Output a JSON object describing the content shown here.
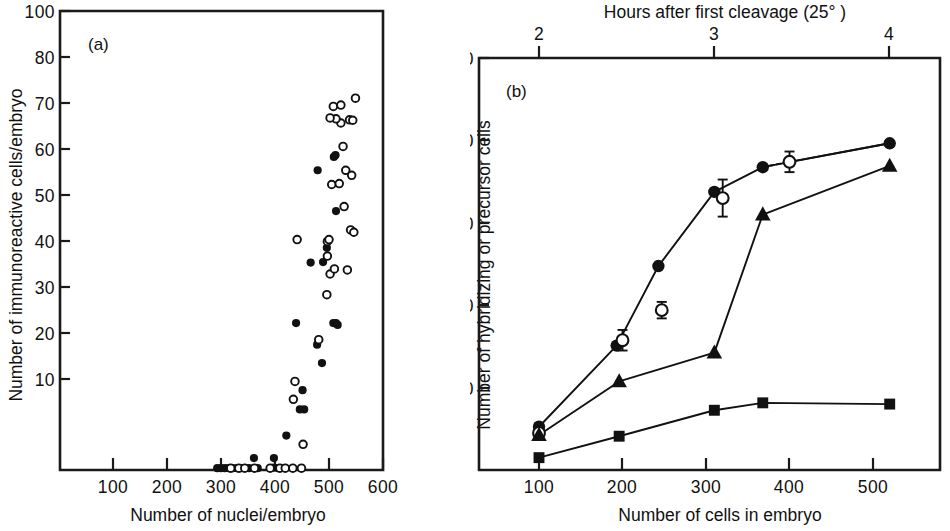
{
  "figure": {
    "panels": [
      "a",
      "b"
    ]
  },
  "panel_a": {
    "label": "(a)",
    "xlabel": "Number of nuclei/embryo",
    "ylabel": "Number of immunoreactive cells/embryo",
    "xticks": [
      "100",
      "200",
      "300",
      "400",
      "500",
      "600"
    ],
    "yticks": [
      "10",
      "20",
      "30",
      "40",
      "50",
      "60",
      "70",
      "80",
      "100"
    ],
    "legend": [
      "filled circle",
      "open circle"
    ]
  },
  "panel_b": {
    "label": "(b)",
    "xlabel": "Number of cells in embryo",
    "ylabel": "Number of hybridizing or precursor cells",
    "toplabel": "Hours after first cleavage (25° )",
    "xticks": [
      "100",
      "200",
      "300",
      "400",
      "500"
    ],
    "topticks": [
      "2",
      "3",
      "4"
    ],
    "yticks": [
      "20",
      "40",
      "60",
      "80",
      "100"
    ]
  },
  "chart_data": [
    {
      "type": "scatter",
      "panel": "a",
      "title": "(a)",
      "xlabel": "Number of nuclei/embryo",
      "ylabel": "Number of immunoreactive cells/embryo",
      "xlim": [
        0,
        650
      ],
      "ylim": [
        0,
        100
      ],
      "xticks": [
        100,
        200,
        300,
        400,
        500,
        600
      ],
      "yticks": [
        10,
        20,
        30,
        40,
        50,
        60,
        70,
        80,
        100
      ],
      "grid": false,
      "legend_position": "none",
      "series": [
        {
          "name": "filled circles",
          "marker": "filled-circle",
          "points": [
            [
              293,
              0.4
            ],
            [
              300,
              0.4
            ],
            [
              307,
              0.4
            ],
            [
              314,
              0.4
            ],
            [
              322,
              0.4
            ],
            [
              330,
              0.4
            ],
            [
              337,
              0.4
            ],
            [
              352,
              0.4
            ],
            [
              361,
              2.6
            ],
            [
              368,
              0.4
            ],
            [
              398,
              2.6
            ],
            [
              398,
              0.5
            ],
            [
              406,
              0.4
            ],
            [
              421,
              7.5
            ],
            [
              446,
              13.2
            ],
            [
              454,
              13.2
            ],
            [
              451,
              17.4
            ],
            [
              439,
              32.0
            ],
            [
              487,
              23.3
            ],
            [
              478,
              27.3
            ],
            [
              508,
              32.0
            ],
            [
              513,
              32.0
            ],
            [
              516,
              31.6
            ],
            [
              466,
              45.2
            ],
            [
              489,
              45.3
            ],
            [
              496,
              48.4
            ],
            [
              479,
              65.3
            ],
            [
              513,
              56.4
            ],
            [
              509,
              68.2
            ],
            [
              512,
              68.6
            ]
          ]
        },
        {
          "name": "open circles",
          "marker": "open-circle",
          "points": [
            [
              318,
              0.4
            ],
            [
              333,
              0.4
            ],
            [
              344,
              0.4
            ],
            [
              362,
              0.4
            ],
            [
              391,
              0.4
            ],
            [
              409,
              0.4
            ],
            [
              419,
              0.4
            ],
            [
              433,
              0.4
            ],
            [
              449,
              0.4
            ],
            [
              452,
              5.6
            ],
            [
              434,
              15.4
            ],
            [
              437,
              19.3
            ],
            [
              481,
              28.4
            ],
            [
              496,
              38.2
            ],
            [
              502,
              42.7
            ],
            [
              441,
              50.2
            ],
            [
              497,
              49.8
            ],
            [
              500,
              50.2
            ],
            [
              497,
              46.6
            ],
            [
              510,
              43.8
            ],
            [
              534,
              43.6
            ],
            [
              540,
              52.3
            ],
            [
              546,
              51.8
            ],
            [
              528,
              57.4
            ],
            [
              505,
              62.2
            ],
            [
              519,
              62.4
            ],
            [
              531,
              65.3
            ],
            [
              542,
              64.2
            ],
            [
              526,
              70.5
            ],
            [
              522,
              75.6
            ],
            [
              513,
              76.5
            ],
            [
              502,
              76.7
            ],
            [
              522,
              79.5
            ],
            [
              538,
              76.3
            ],
            [
              544,
              76.2
            ],
            [
              549,
              81.0
            ],
            [
              508,
              79.2
            ]
          ]
        }
      ]
    },
    {
      "type": "line",
      "panel": "b",
      "title": "(b)",
      "xlabel": "Number of cells in embryo",
      "ylabel": "Number of hybridizing or precursor cells",
      "top_xlabel": "Hours after first cleavage (25° )",
      "xlim": [
        50,
        560
      ],
      "ylim": [
        0,
        100
      ],
      "xticks": [
        100,
        200,
        300,
        400,
        500
      ],
      "top_xticks": [
        2,
        3,
        4
      ],
      "top_x_positions": [
        140,
        310,
        480
      ],
      "yticks": [
        20,
        40,
        60,
        80,
        100
      ],
      "grid": false,
      "legend_position": "none",
      "series": [
        {
          "name": "filled circles",
          "marker": "filled-circle",
          "connected": true,
          "x": [
            100,
            193,
            243,
            310,
            368,
            520
          ],
          "y": [
            10.5,
            30.2,
            49.5,
            67.5,
            73.5,
            79.3
          ],
          "errors": [
            null,
            null,
            null,
            null,
            null,
            null
          ]
        },
        {
          "name": "open circles",
          "marker": "open-circle",
          "connected": false,
          "x": [
            100,
            200,
            247,
            320,
            400
          ],
          "y": [
            9.0,
            31.5,
            38.8,
            66.0,
            74.8
          ],
          "errors": [
            null,
            2.5,
            2.0,
            4.5,
            2.5
          ]
        },
        {
          "name": "filled triangles",
          "marker": "filled-triangle",
          "connected": true,
          "x": [
            100,
            196,
            310,
            368,
            520
          ],
          "y": [
            8.5,
            21.5,
            28.5,
            62.0,
            73.8
          ],
          "errors": [
            null,
            null,
            null,
            null,
            null
          ]
        },
        {
          "name": "filled squares",
          "marker": "filled-square",
          "connected": true,
          "x": [
            100,
            196,
            310,
            368,
            520
          ],
          "y": [
            3.0,
            8.2,
            14.5,
            16.3,
            16.0
          ],
          "errors": [
            null,
            null,
            null,
            null,
            null
          ]
        }
      ]
    }
  ]
}
